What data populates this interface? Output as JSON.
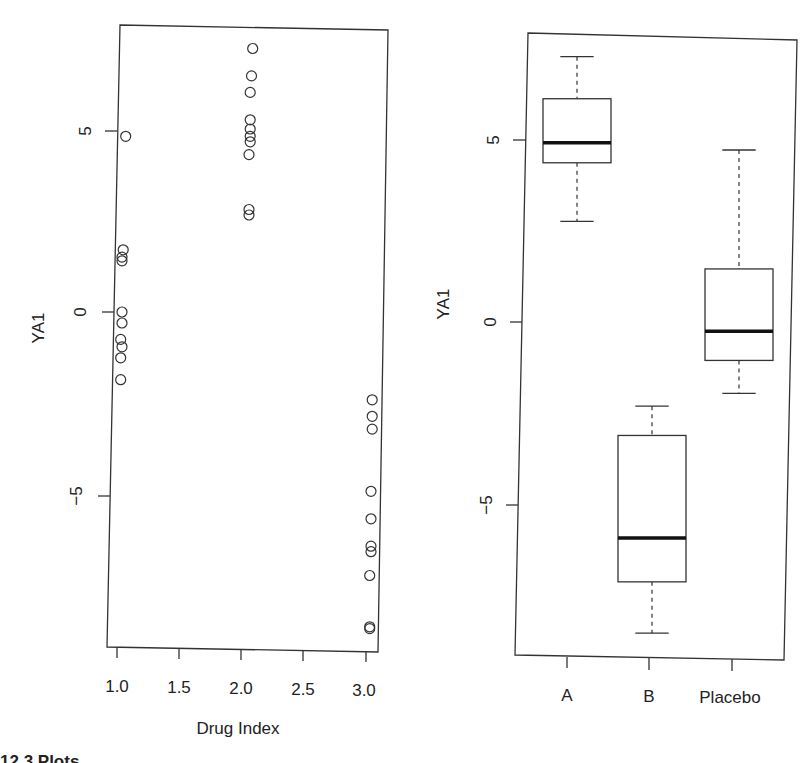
{
  "chart_data": [
    {
      "type": "scatter",
      "title": "",
      "xlabel": "Drug Index",
      "ylabel": "YA1",
      "xlim": [
        0.95,
        3.07
      ],
      "ylim": [
        -9.1,
        8.0
      ],
      "grid": false,
      "legend": null,
      "x_ticks": [
        1.0,
        1.5,
        2.0,
        2.5,
        3.0
      ],
      "x_tick_labels": [
        "1.0",
        "1.5",
        "2.0",
        "2.5",
        "3.0"
      ],
      "y_ticks": [
        5,
        0,
        -5
      ],
      "y_tick_labels": [
        "5",
        "0",
        "-5"
      ],
      "series": [
        {
          "name": "Drug 1 (A)",
          "x": [
            1.07,
            1.05,
            1.04,
            1.04,
            1.04,
            1.04,
            1.03,
            1.04,
            1.03,
            1.03
          ],
          "y": [
            4.8,
            1.7,
            1.5,
            1.4,
            0.0,
            -0.3,
            -0.75,
            -0.95,
            -1.25,
            -1.85
          ]
        },
        {
          "name": "Drug 2 (B)",
          "x": [
            2.09,
            2.08,
            2.07,
            2.07,
            2.07,
            2.07,
            2.07,
            2.06,
            2.06,
            2.06
          ],
          "y": [
            7.2,
            6.45,
            6.0,
            5.25,
            5.0,
            4.8,
            4.65,
            4.3,
            2.8,
            2.65
          ]
        },
        {
          "name": "Drug 3 (Placebo)",
          "x": [
            3.05,
            3.05,
            3.05,
            3.04,
            3.04,
            3.04,
            3.04,
            3.03,
            3.03,
            3.03
          ],
          "y": [
            -2.4,
            -2.85,
            -3.2,
            -4.9,
            -5.65,
            -6.4,
            -6.55,
            -7.2,
            -8.6,
            -8.65
          ]
        }
      ]
    },
    {
      "type": "box",
      "title": "",
      "xlabel": "",
      "ylabel": "YA1",
      "ylim": [
        -9.1,
        8.0
      ],
      "grid": false,
      "categories": [
        "A",
        "B",
        "Placebo"
      ],
      "y_ticks": [
        5,
        0,
        -5
      ],
      "y_tick_labels": [
        "5",
        "0",
        "-5"
      ],
      "boxes": [
        {
          "name": "A",
          "min": 2.75,
          "q1": 4.35,
          "median": 4.9,
          "q3": 6.1,
          "max": 7.25
        },
        {
          "name": "B",
          "min": -8.5,
          "q1": -7.1,
          "median": -5.9,
          "q3": -3.1,
          "max": -2.3
        },
        {
          "name": "Placebo",
          "min": -1.95,
          "q1": -1.05,
          "median": -0.25,
          "q3": 1.45,
          "max": 4.7
        }
      ]
    }
  ],
  "left_plot": {
    "ylabel": "YA1",
    "xlabel": "Drug Index",
    "y_tick_labels": [
      "5",
      "0",
      "-5"
    ],
    "x_tick_labels": [
      "1.0",
      "1.5",
      "2.0",
      "2.5",
      "3.0"
    ]
  },
  "right_plot": {
    "ylabel": "YA1",
    "y_tick_labels": [
      "5",
      "0",
      "-5"
    ],
    "x_tick_labels": [
      "A",
      "B",
      "Placebo"
    ]
  },
  "caption_fragment": "12.3 Plots"
}
